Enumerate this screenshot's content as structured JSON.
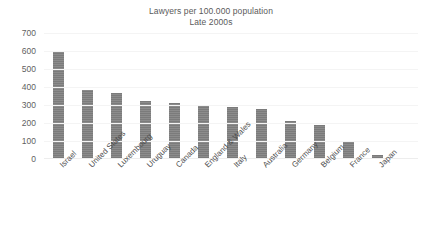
{
  "chart_data": {
    "type": "bar",
    "title": "Lawyers per 100.000 population",
    "subtitle": "Late 2000s",
    "xlabel": "",
    "ylabel": "",
    "ylim": [
      0,
      700
    ],
    "ytick_step": 100,
    "yticks": [
      700,
      600,
      500,
      400,
      300,
      200,
      100,
      0
    ],
    "ytick_labels": [
      "700",
      "600",
      "500",
      "400",
      "300",
      "200",
      "100",
      "0"
    ],
    "grid": true,
    "legend": false,
    "legend_position": "none",
    "bar_color": "#7f7f7f",
    "categories": [
      "Israel",
      "United States",
      "Luxembourg",
      "Uruguay",
      "Canada",
      "England & Wales",
      "Italy",
      "Australia",
      "Germany",
      "Belgium",
      "France",
      "Japan"
    ],
    "values": [
      595,
      385,
      365,
      320,
      310,
      300,
      290,
      280,
      210,
      190,
      100,
      20
    ]
  }
}
